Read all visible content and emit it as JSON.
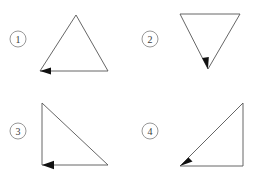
{
  "figure": {
    "background_color": "#ffffff",
    "stroke_color": "#555555",
    "label_circle_color": "#8c8c8c",
    "label_text_color": "#3a3a3a",
    "arrow_color": "#111111",
    "width": 261,
    "height": 183
  },
  "panels": [
    {
      "id": "panel-1",
      "label": "1",
      "label_circle": {
        "cx": 18,
        "cy": 39,
        "r": 8
      },
      "shape_name": "upright-triangle",
      "vertices": [
        {
          "x": 76,
          "y": 15
        },
        {
          "x": 108,
          "y": 71
        },
        {
          "x": 40,
          "y": 71
        }
      ],
      "path": "M 76 15 L 108 71 L 40 71 Z",
      "arrow": {
        "name": "direction-arrow-1",
        "tip_x": 40,
        "tip_y": 71,
        "angle_deg": 180,
        "points": "40,71 51,67.4 51,74.6"
      }
    },
    {
      "id": "panel-2",
      "label": "2",
      "label_circle": {
        "cx": 150,
        "cy": 39,
        "r": 8
      },
      "shape_name": "inverted-triangle",
      "vertices": [
        {
          "x": 180,
          "y": 14
        },
        {
          "x": 240,
          "y": 14
        },
        {
          "x": 208,
          "y": 69
        }
      ],
      "path": "M 180 14 L 240 14 L 208 69 Z",
      "arrow": {
        "name": "direction-arrow-2",
        "tip_x": 208,
        "tip_y": 69,
        "angle_deg": 120,
        "points": "208,69 202.1,58.1 208.8,56.9"
      }
    },
    {
      "id": "panel-3",
      "label": "3",
      "label_circle": {
        "cx": 18,
        "cy": 131,
        "r": 8
      },
      "shape_name": "right-triangle-left-leg",
      "vertices": [
        {
          "x": 42,
          "y": 103
        },
        {
          "x": 108,
          "y": 165
        },
        {
          "x": 42,
          "y": 165
        }
      ],
      "path": "M 42 103 L 108 165 L 42 165 Z",
      "arrow": {
        "name": "direction-arrow-3",
        "tip_x": 42,
        "tip_y": 165,
        "angle_deg": 180,
        "points": "42,165 54,160.8 54,169.2"
      }
    },
    {
      "id": "panel-4",
      "label": "4",
      "label_circle": {
        "cx": 150,
        "cy": 131,
        "r": 8
      },
      "shape_name": "right-triangle-right-leg",
      "vertices": [
        {
          "x": 243,
          "y": 103
        },
        {
          "x": 243,
          "y": 166
        },
        {
          "x": 180,
          "y": 166
        }
      ],
      "path": "M 243 103 L 243 166 L 180 166 Z",
      "arrow": {
        "name": "direction-arrow-4",
        "tip_x": 180,
        "tip_y": 166,
        "angle_deg": 135,
        "points": "180,166 188.5,157.5 192.5,161.5"
      }
    }
  ]
}
